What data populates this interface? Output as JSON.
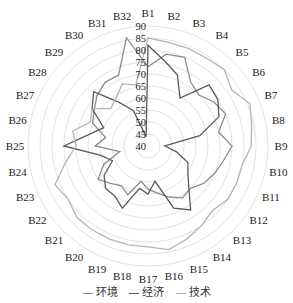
{
  "chart_data": {
    "type": "radar",
    "title": "",
    "categories": [
      "B1",
      "B2",
      "B3",
      "B4",
      "B5",
      "B6",
      "B7",
      "B8",
      "B9",
      "B10",
      "B11",
      "B12",
      "B13",
      "B14",
      "B15",
      "B16",
      "B17",
      "B18",
      "B19",
      "B20",
      "B21",
      "B22",
      "B23",
      "B24",
      "B25",
      "B26",
      "B27",
      "B28",
      "B29",
      "B30",
      "B31",
      "B32"
    ],
    "radial_ticks": [
      40,
      45,
      50,
      55,
      60,
      65,
      70,
      75,
      80,
      85,
      90
    ],
    "rlim": [
      40,
      90
    ],
    "grid": true,
    "legend_position": "bottom",
    "series": [
      {
        "name": "环境",
        "color": "#8c8c8c",
        "values": [
          73,
          79,
          80,
          72,
          70,
          73,
          75,
          70,
          75,
          72,
          70,
          68,
          65,
          66,
          63,
          60,
          58,
          55,
          62,
          60,
          62,
          65,
          60,
          52,
          62,
          58,
          65,
          67,
          70,
          72,
          72,
          86
        ]
      },
      {
        "name": "经济",
        "color": "#5a5a5a",
        "values": [
          82,
          76,
          72,
          64,
          76,
          75,
          72,
          62,
          47,
          52,
          58,
          60,
          64,
          72,
          68,
          55,
          60,
          58,
          68,
          65,
          65,
          62,
          56,
          60,
          75,
          65,
          60,
          68,
          72,
          62,
          56,
          44
        ]
      },
      {
        "name": "技术",
        "color": "#b5b5b5",
        "values": [
          85,
          84,
          84,
          84,
          85,
          82,
          86,
          84,
          83,
          80,
          80,
          80,
          78,
          80,
          82,
          84,
          82,
          82,
          82,
          82,
          82,
          80,
          82,
          75,
          70,
          72,
          66,
          68,
          62,
          64,
          68,
          66
        ]
      }
    ]
  },
  "legend": {
    "items": [
      {
        "label": "环境",
        "color": "#8c8c8c"
      },
      {
        "label": "经济",
        "color": "#5a5a5a"
      },
      {
        "label": "技术",
        "color": "#b5b5b5"
      }
    ]
  }
}
